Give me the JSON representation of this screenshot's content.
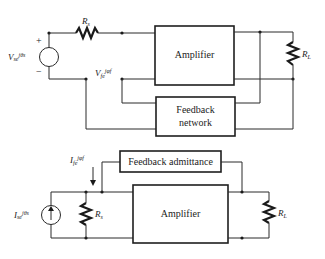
{
  "top_circuit": {
    "source_label": "V_s e^{jθ_s}",
    "source_label_main": "V",
    "source_label_rest": "se",
    "source_label_exp": "jθs",
    "plus_sign": "+",
    "minus_sign": "−",
    "series_resistor": "R",
    "series_resistor_sub": "s",
    "amplifier_label": "Amplifier",
    "feedback_label_line1": "Feedback",
    "feedback_label_line2": "network",
    "feedback_voltage": "V",
    "feedback_voltage_rest": "fe",
    "feedback_voltage_exp": "jφf",
    "load_resistor": "R",
    "load_resistor_sub": "L"
  },
  "bottom_circuit": {
    "source_label_main": "I",
    "source_label_rest": "se",
    "source_label_exp": "jθs",
    "feedback_current": "I",
    "feedback_current_rest": "fe",
    "feedback_current_exp": "jφf",
    "shunt_resistor": "R",
    "shunt_resistor_sub": "s",
    "feedback_label": "Feedback admittance",
    "amplifier_label": "Amplifier",
    "load_resistor": "R",
    "load_resistor_sub": "L"
  }
}
